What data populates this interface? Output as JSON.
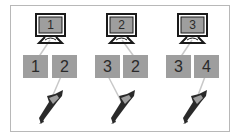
{
  "groups": [
    {
      "monitor_label": "1",
      "boxes": [
        "1",
        "2"
      ],
      "monitor_linked_box": 0,
      "bird_linked_box": 1
    },
    {
      "monitor_label": "2",
      "boxes": [
        "3",
        "2"
      ],
      "monitor_linked_box": 1,
      "bird_linked_box": 0
    },
    {
      "monitor_label": "3",
      "boxes": [
        "3",
        "4"
      ],
      "monitor_linked_box": 0,
      "bird_linked_box": 1
    }
  ],
  "colors": {
    "box_fill": "#9e9e9e",
    "screen_fill": "#9e9e9e",
    "monitor_outline": "#1a1a1a",
    "link_line": "#c8c8c8",
    "frame_border": "#b8b8b8"
  }
}
